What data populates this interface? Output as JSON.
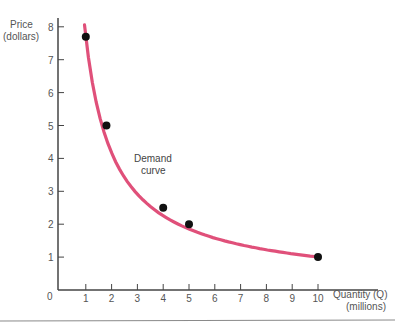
{
  "chart_data": {
    "type": "line",
    "title": "",
    "xlabel": "Quantity (Q)",
    "xlabel_sub": "(millions)",
    "ylabel": "Price",
    "ylabel_sub": "(dollars)",
    "xlim": [
      0,
      10.5
    ],
    "ylim": [
      0,
      8.2
    ],
    "x_ticks": [
      0,
      1,
      2,
      3,
      4,
      5,
      6,
      7,
      8,
      9,
      10
    ],
    "y_ticks": [
      1,
      2,
      3,
      4,
      5,
      6,
      7,
      8
    ],
    "grid": false,
    "legend": null,
    "series": [
      {
        "name": "Demand curve",
        "color": "#e0507a",
        "points": [
          {
            "x": 1.0,
            "y": 7.7
          },
          {
            "x": 1.8,
            "y": 5.0
          },
          {
            "x": 4.0,
            "y": 2.5
          },
          {
            "x": 5.0,
            "y": 2.0
          },
          {
            "x": 10.0,
            "y": 1.0
          }
        ]
      }
    ],
    "annotations": [
      {
        "text": "Demand curve",
        "lines": [
          "Demand",
          "curve"
        ],
        "x": 3.1,
        "y": 3.5
      }
    ]
  },
  "labels": {
    "y_title_1": "Price",
    "y_title_2": "(dollars)",
    "x_title_1": "Quantity (Q)",
    "x_title_2": "(millions)",
    "origin": "0",
    "annot_1": "Demand",
    "annot_2": "curve"
  },
  "colors": {
    "axis": "#444444",
    "curve": "#e0507a",
    "point": "#111111",
    "rule": "#888888"
  }
}
